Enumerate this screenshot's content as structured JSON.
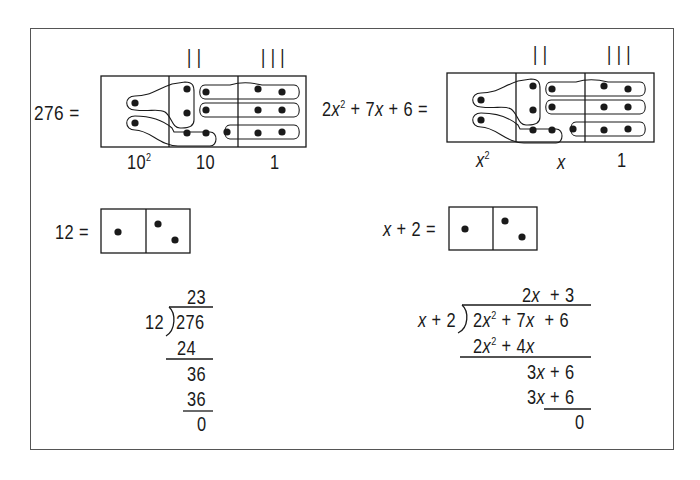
{
  "colors": {
    "ink": "#1a1a1a",
    "frame": "#555555",
    "background": "#ffffff"
  },
  "top_left": {
    "lhs": "276 =",
    "tally_marks": {
      "tens": "| |",
      "ones": "| | |"
    },
    "column_labels": {
      "hundreds": "10",
      "hundreds_exp": "2",
      "tens": "10",
      "ones": "1"
    }
  },
  "top_right": {
    "lhs_parts": {
      "a": "2",
      "var1": "x",
      "exp": "2",
      "rest1": " + 7",
      "var2": "x",
      "rest2": " + 6 ="
    },
    "tally_marks": {
      "tens": "| |",
      "ones": "| | |"
    },
    "column_labels": {
      "squared_var": "x",
      "squared_exp": "2",
      "linear": "x",
      "ones": "1"
    }
  },
  "middle_left": {
    "lhs": "12 ="
  },
  "middle_right": {
    "lhs_var": "x",
    "lhs_rest": " + 2 ="
  },
  "long_division_numeric": {
    "quotient": "23",
    "divisor": "12",
    "dividend": "276",
    "step1": "24",
    "step2": "36",
    "step3": "36",
    "remainder": "0"
  },
  "long_division_polynomial": {
    "quotient": {
      "t1": "2",
      "v1": "x",
      "t2": "  + 3"
    },
    "divisor": {
      "v": "x",
      "rest": " + 2"
    },
    "dividend": {
      "a": "2",
      "v1": "x",
      "e": "2",
      "b": " + 7",
      "v2": "x",
      "c": "  + 6"
    },
    "step1": {
      "a": "2",
      "v1": "x",
      "e": "2",
      "b": " + 4",
      "v2": "x"
    },
    "step2": {
      "a": "3",
      "v": "x",
      "b": " + 6"
    },
    "step3": {
      "a": "3",
      "v": "x",
      "b": " + 6"
    },
    "remainder": "0"
  }
}
